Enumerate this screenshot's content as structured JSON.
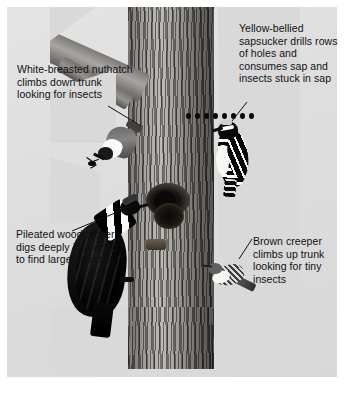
{
  "figure": {
    "background_color": "#ffffff",
    "panel_color": "#dedede",
    "text_color": "#111111"
  },
  "callouts": [
    {
      "id": "nuthatch",
      "bird": "White-breasted nuthatch",
      "text": "White-breasted nuthatch climbs down trunk looking for insects",
      "position": "upper-left"
    },
    {
      "id": "sapsucker",
      "bird": "Yellow-bellied sapsucker",
      "text": "Yellow-bellied sapsucker drills rows of holes and consumes sap and insects stuck in sap",
      "position": "upper-right"
    },
    {
      "id": "pileated",
      "bird": "Pileated woodpecker",
      "text": "Pileated woodpecker digs deeply into wood to find large insects",
      "position": "lower-left"
    },
    {
      "id": "creeper",
      "bird": "Brown creeper",
      "text": "Brown creeper climbs up trunk looking for tiny insects",
      "position": "lower-right"
    }
  ],
  "scene": {
    "subject": "tree-trunk",
    "sapsucker_holes_count": 8,
    "cavity_label": "excavated-cavity",
    "birds": [
      "white-breasted-nuthatch",
      "yellow-bellied-sapsucker",
      "pileated-woodpecker",
      "brown-creeper"
    ]
  }
}
